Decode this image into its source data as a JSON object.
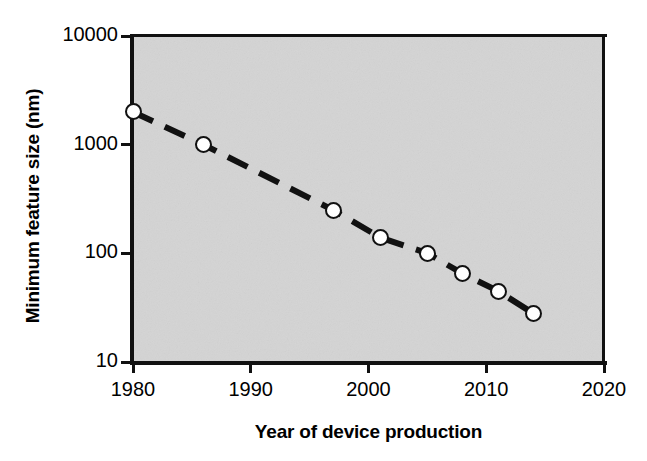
{
  "figure": {
    "background_color": "#ffffff",
    "plot_background_color": "#d4d4d4",
    "axis_color": "#111111",
    "marker_fill_color": "#ffffff",
    "marker_edge_color": "#111111"
  },
  "chart_data": {
    "type": "scatter",
    "title": "",
    "subtitle": "",
    "xlabel": "Year of device production",
    "ylabel": "Minimum feature size (nm)",
    "x": [
      1980,
      1986,
      1997,
      2001,
      2005,
      2008,
      2011,
      2014
    ],
    "values": [
      2000,
      1000,
      250,
      140,
      100,
      65,
      45,
      28
    ],
    "series": [
      {
        "name": "Minimum feature size",
        "x": [
          1980,
          1986,
          1997,
          2001,
          2005,
          2008,
          2011,
          2014
        ],
        "values": [
          2000,
          1000,
          250,
          140,
          100,
          65,
          45,
          28
        ],
        "marker": "open-circle",
        "line_style": "dashed",
        "line_color": "#111111"
      }
    ],
    "xlim": [
      1980,
      2020
    ],
    "ylim": [
      10,
      10000
    ],
    "yscale": "log",
    "xscale": "linear",
    "grid": false,
    "legend": false,
    "legend_position": "none",
    "x_ticks": [
      "1980",
      "1990",
      "2000",
      "2010",
      "2020"
    ],
    "x_tick_values": [
      1980,
      1990,
      2000,
      2010,
      2020
    ],
    "y_ticks": [
      "10000",
      "1000",
      "100",
      "10"
    ],
    "y_tick_values": [
      10000,
      1000,
      100,
      10
    ],
    "annotations": []
  }
}
